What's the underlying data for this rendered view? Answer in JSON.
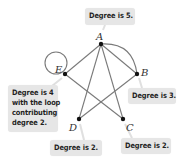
{
  "graph": {
    "vertices": [
      {
        "id": "A",
        "label": "A",
        "x": 101,
        "y": 44,
        "lx": 96,
        "ly": 39
      },
      {
        "id": "B",
        "label": "B",
        "x": 137,
        "y": 74,
        "lx": 142,
        "ly": 74
      },
      {
        "id": "C",
        "label": "C",
        "x": 123,
        "y": 119,
        "lx": 126,
        "ly": 130
      },
      {
        "id": "D",
        "label": "D",
        "x": 79,
        "y": 119,
        "lx": 69,
        "ly": 130
      },
      {
        "id": "E",
        "label": "E",
        "x": 65,
        "y": 74,
        "lx": 55,
        "ly": 72
      }
    ],
    "edges": [
      [
        "A",
        "E"
      ],
      [
        "A",
        "B"
      ],
      [
        "A",
        "D"
      ],
      [
        "A",
        "C"
      ],
      [
        "E",
        "C"
      ],
      [
        "B",
        "D"
      ]
    ],
    "curved_edges": [
      [
        "A",
        "B"
      ]
    ],
    "loops": [
      {
        "vertex": "E",
        "cx": 56,
        "cy": 63,
        "r": 11
      }
    ],
    "colors": {
      "edge": "#7a7a7a",
      "vertex": "#111111",
      "callout_bg": "#e6e6e6",
      "callout_text": "#1f1f1f"
    }
  },
  "callouts": {
    "A": {
      "text": "Degree is 5."
    },
    "B": {
      "text": "Degree is 3."
    },
    "C": {
      "text": "Degree is 2."
    },
    "D": {
      "text": "Degree is 2."
    },
    "E": {
      "lines": [
        "Degree is 4",
        "with the loop",
        "contributing",
        "degree 2."
      ]
    }
  },
  "labels": {
    "A": "A",
    "B": "B",
    "C": "C",
    "D": "D",
    "E": "E"
  }
}
